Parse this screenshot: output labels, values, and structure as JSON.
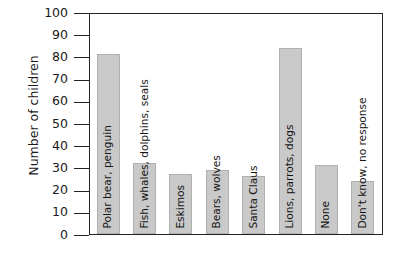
{
  "chart_data": {
    "type": "bar",
    "title": "",
    "xlabel": "",
    "ylabel": "Number of children",
    "ylim": [
      0,
      100
    ],
    "ytick_step": 10,
    "yticks": [
      100,
      90,
      80,
      70,
      60,
      50,
      40,
      30,
      20,
      10,
      0
    ],
    "grid": false,
    "legend": "none",
    "orientation": "vertical",
    "bar_color": "#c9c9c9",
    "bar_edge_color": "#b0b0b0",
    "axis_color": "#222222",
    "categories": [
      "Polar bear, penguin",
      "Fish, whales, dolphins, seals",
      "Eskimos",
      "Bears, wolves",
      "Santa Claus",
      "Lions, parrots, dogs",
      "None",
      "Don't know, no response"
    ],
    "values": [
      81,
      32,
      27,
      29,
      26,
      84,
      31,
      24
    ],
    "label_placement": "inside-bar-rotated-vertical"
  }
}
